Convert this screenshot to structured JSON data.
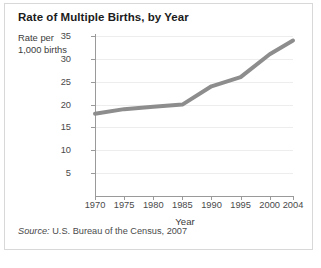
{
  "figure": {
    "title": "Rate of Multiple Births, by Year",
    "source_label": "Source:",
    "source_text": "U.S. Bureau of the Census, 2007"
  },
  "chart_data": {
    "type": "line",
    "title": "Rate of Multiple Births, by Year",
    "xlabel": "Year",
    "ylabel": "Rate per 1,000 births",
    "ylabel_lines": [
      "Rate per",
      "1,000 births"
    ],
    "x": [
      1970,
      1975,
      1980,
      1985,
      1990,
      1995,
      2000,
      2004
    ],
    "categories": [
      "1970",
      "1975",
      "1980",
      "1985",
      "1990",
      "1995",
      "2000",
      "2004"
    ],
    "values": [
      18,
      19,
      19.5,
      20,
      24,
      26,
      31,
      34
    ],
    "series": [
      {
        "name": "Rate of multiple births",
        "values": [
          18,
          19,
          19.5,
          20,
          24,
          26,
          31,
          34
        ],
        "color": "#8d8d8d"
      }
    ],
    "xlim": [
      1970,
      2004
    ],
    "ylim": [
      0,
      35
    ],
    "yticks": [
      35,
      30,
      25,
      20,
      15,
      10,
      5
    ],
    "ytick_labels": [
      "35",
      "30",
      "25",
      "20",
      "15",
      "10",
      "5"
    ],
    "xticks": [
      1970,
      1975,
      1980,
      1985,
      1990,
      1995,
      2000,
      2004
    ],
    "xtick_labels": [
      "1970",
      "1975",
      "1980",
      "1985",
      "1990",
      "1995",
      "2000",
      "2004"
    ],
    "grid": true,
    "grid_axis": "y",
    "grid_color": "#ededed",
    "legend": false,
    "markers": false,
    "line_width_px": 4,
    "axis_color": "#9a9a9a",
    "background": "#ffffff",
    "border_color": "#d8d8d8"
  }
}
